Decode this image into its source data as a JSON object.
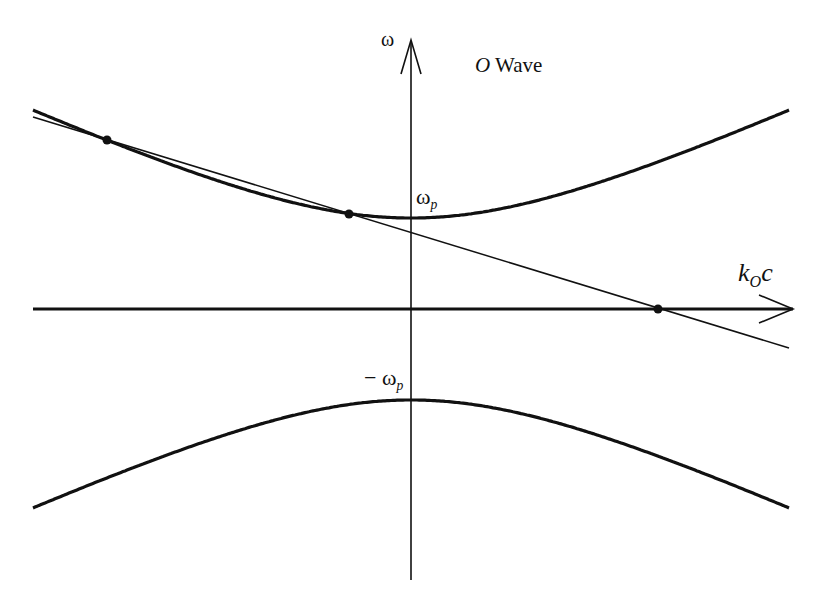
{
  "title": "O Wave",
  "title_parts": {
    "italic": "O",
    "rest": " Wave"
  },
  "axes": {
    "y_label": "ω",
    "x_label": {
      "main": "k",
      "sub": "O",
      "tail": "c"
    }
  },
  "annotations": {
    "upper_vertex": {
      "symbol": "ω",
      "sub": "p"
    },
    "lower_vertex": {
      "prefix": "− ω",
      "sub": "p"
    }
  },
  "geometry": {
    "origin": [
      411,
      309
    ],
    "omega_p_px": 91,
    "k_scale": 0.468,
    "x_range_px": [
      33,
      789
    ],
    "line": {
      "from": [
        33,
        117
      ],
      "to": [
        789,
        348
      ]
    },
    "points": [
      [
        107,
        140
      ],
      [
        349,
        214
      ],
      [
        658,
        309
      ]
    ]
  },
  "colors": {
    "ink": "#111111",
    "background": "#ffffff"
  }
}
